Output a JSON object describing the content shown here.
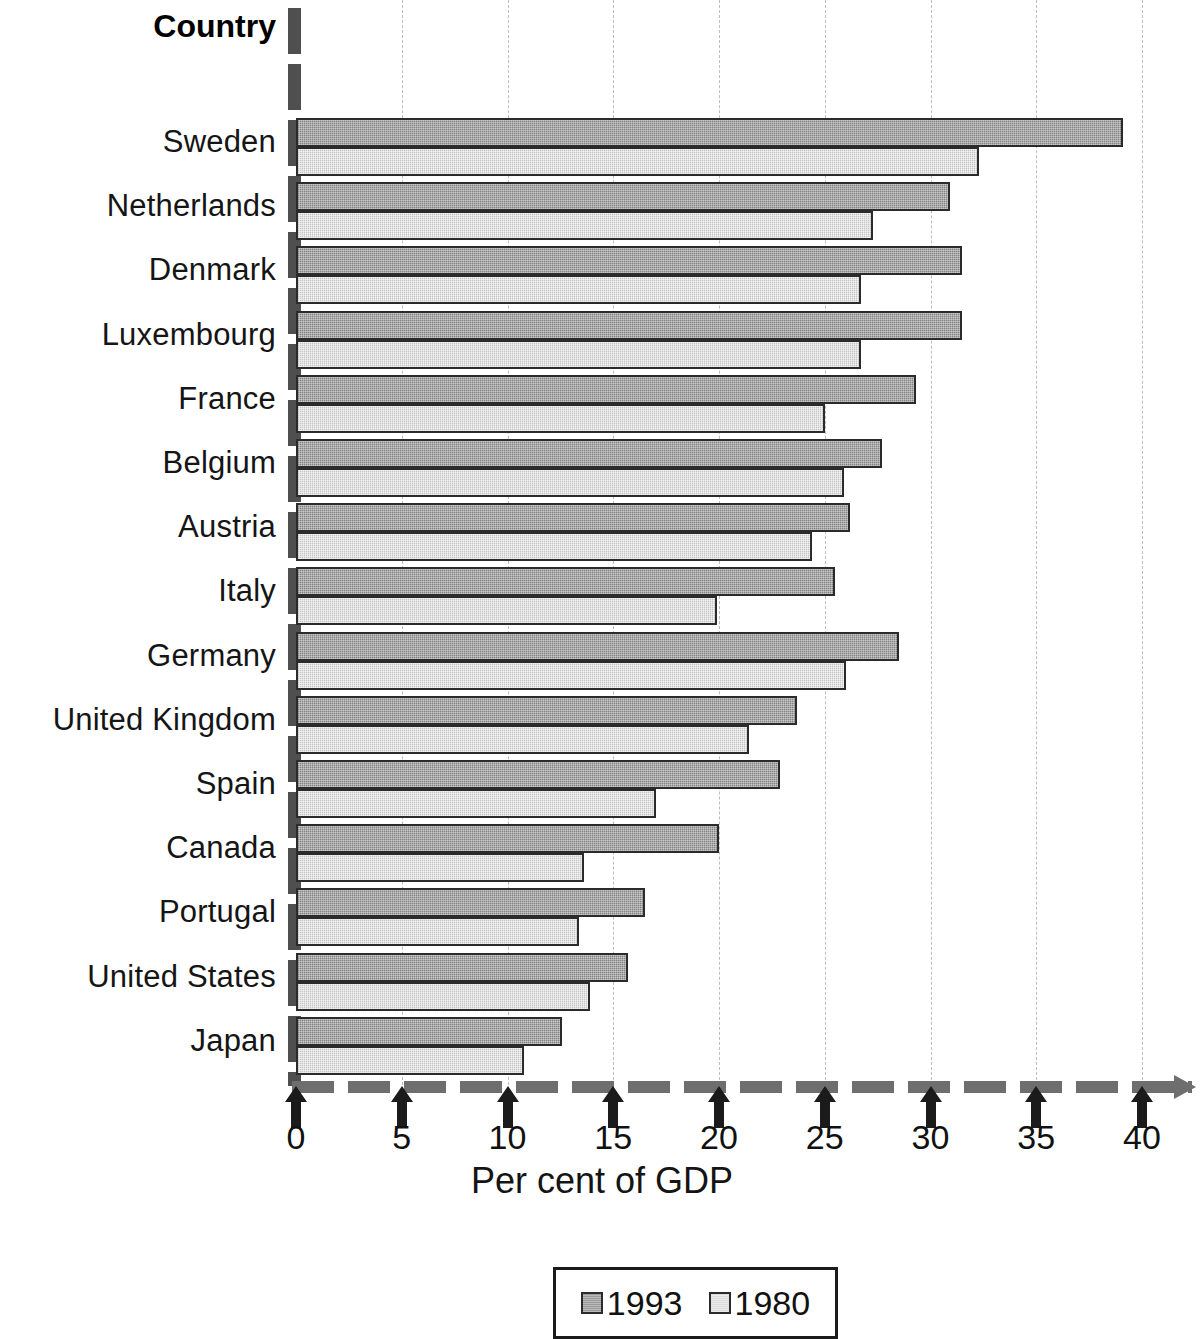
{
  "chart_data": {
    "type": "bar",
    "orientation": "horizontal",
    "title": "Country",
    "xlabel": "Per cent of GDP",
    "ylabel": "Country",
    "xlim": [
      0,
      42
    ],
    "xticks": [
      0,
      5,
      10,
      15,
      20,
      25,
      30,
      35,
      40
    ],
    "xticklabels": [
      "0",
      "5",
      "10",
      "15",
      "20",
      "25",
      "30",
      "35",
      "40"
    ],
    "grid": "vertical-dashed",
    "legend_position": "bottom-center",
    "categories": [
      "Sweden",
      "Netherlands",
      "Denmark",
      "Luxembourg",
      "France",
      "Belgium",
      "Austria",
      "Italy",
      "Germany",
      "United Kingdom",
      "Spain",
      "Canada",
      "Portugal",
      "United States",
      "Japan"
    ],
    "series": [
      {
        "name": "1993",
        "color": "#9a9a9a",
        "values": [
          39.1,
          30.9,
          31.5,
          31.5,
          29.3,
          27.7,
          26.2,
          25.5,
          28.5,
          23.7,
          22.9,
          20.0,
          16.5,
          15.7,
          12.6
        ]
      },
      {
        "name": "1980",
        "color": "#dcdcdc",
        "values": [
          32.3,
          27.3,
          26.7,
          26.7,
          25.0,
          25.9,
          24.4,
          19.9,
          26.0,
          21.4,
          17.0,
          13.6,
          13.4,
          13.9,
          10.8
        ]
      }
    ]
  },
  "legend": {
    "entries": [
      {
        "label": "1993",
        "swatch": "swatch-1993"
      },
      {
        "label": "1980",
        "swatch": "swatch-1980"
      }
    ]
  },
  "colors": {
    "series_1993": "#9a9a9a",
    "series_1980": "#dcdcdc",
    "axis": "#4f4f4f",
    "grid": "#bdbdbd",
    "text": "#111111"
  }
}
